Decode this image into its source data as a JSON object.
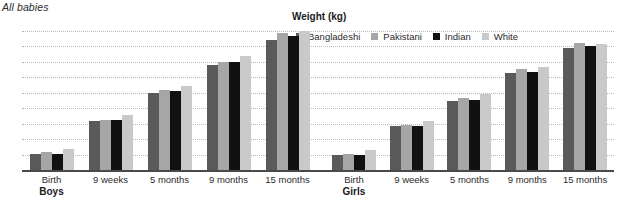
{
  "caption": "All babies",
  "colors": {
    "bangladeshi": "#5a5a5a",
    "pakistani": "#a6a6a6",
    "indian": "#111111",
    "white": "#c9c9c9",
    "gridline": "#b9b9b9",
    "axis": "#4a4a4a",
    "text": "#2b2b2b"
  },
  "chart_data": {
    "type": "bar",
    "title": "Weight (kg)",
    "xlabel": "",
    "ylabel": "",
    "ylim": [
      2,
      11
    ],
    "yticks": [
      11,
      10,
      9,
      8,
      7,
      6,
      5,
      4,
      3,
      2
    ],
    "grid": true,
    "legend_position": "top-right",
    "categories": [
      "Birth",
      "9 weeks",
      "5 months",
      "9 months",
      "15 months"
    ],
    "panels": [
      {
        "name": "Boys",
        "series": [
          {
            "name": "Bangladeshi",
            "values": [
              3.05,
              5.2,
              7.0,
              8.8,
              10.4
            ]
          },
          {
            "name": "Pakistani",
            "values": [
              3.15,
              5.25,
              7.15,
              9.0,
              10.9
            ]
          },
          {
            "name": "Indian",
            "values": [
              3.05,
              5.25,
              7.1,
              9.0,
              10.7
            ]
          },
          {
            "name": "White",
            "values": [
              3.35,
              5.55,
              7.45,
              9.4,
              11.0
            ]
          }
        ]
      },
      {
        "name": "Girls",
        "series": [
          {
            "name": "Bangladeshi",
            "values": [
              3.0,
              4.85,
              6.5,
              8.25,
              9.9
            ]
          },
          {
            "name": "Pakistani",
            "values": [
              3.05,
              4.9,
              6.65,
              8.55,
              10.2
            ]
          },
          {
            "name": "Indian",
            "values": [
              3.0,
              4.85,
              6.55,
              8.35,
              10.05
            ]
          },
          {
            "name": "White",
            "values": [
              3.3,
              5.15,
              6.9,
              8.7,
              10.15
            ]
          }
        ]
      }
    ],
    "legend": [
      {
        "label": "Bangladeshi",
        "color": "#5a5a5a"
      },
      {
        "label": "Pakistani",
        "color": "#a6a6a6"
      },
      {
        "label": "Indian",
        "color": "#111111"
      },
      {
        "label": "White",
        "color": "#c9c9c9"
      }
    ]
  }
}
